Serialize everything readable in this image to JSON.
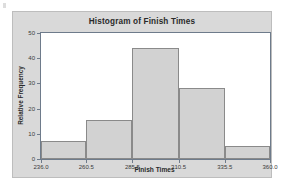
{
  "page": {
    "background_color": "#ffffff",
    "panel_color": "#d9d9d9"
  },
  "chart_data": {
    "type": "bar",
    "title": "Histogram of Finish Times",
    "xlabel": "Finish Times",
    "ylabel": "Relative Frequency",
    "categories": [
      "236.0-260.5",
      "260.5-285.5",
      "285.5-310.5",
      "310.5-335.5",
      "335.5-360.0"
    ],
    "bin_edges": [
      236.0,
      260.5,
      285.5,
      310.5,
      335.5,
      360.0
    ],
    "values": [
      7,
      15.5,
      44,
      28,
      5
    ],
    "xtick_labels": [
      "236.0",
      "260.5",
      "285.5",
      "310.5",
      "335.5",
      "360.0"
    ],
    "ytick_labels": [
      "0",
      "10",
      "20",
      "30",
      "40",
      "50"
    ],
    "ytick_values": [
      0,
      10,
      20,
      30,
      40,
      50
    ],
    "ylim": [
      0,
      50
    ],
    "xlim": [
      236.0,
      360.0
    ],
    "grid": false,
    "legend": false,
    "bar_fill_color": "#d2d2d2",
    "bar_border_color": "#8a8a8a",
    "axis_color": "#6e7b8b",
    "plot_background": "#ffffff"
  }
}
